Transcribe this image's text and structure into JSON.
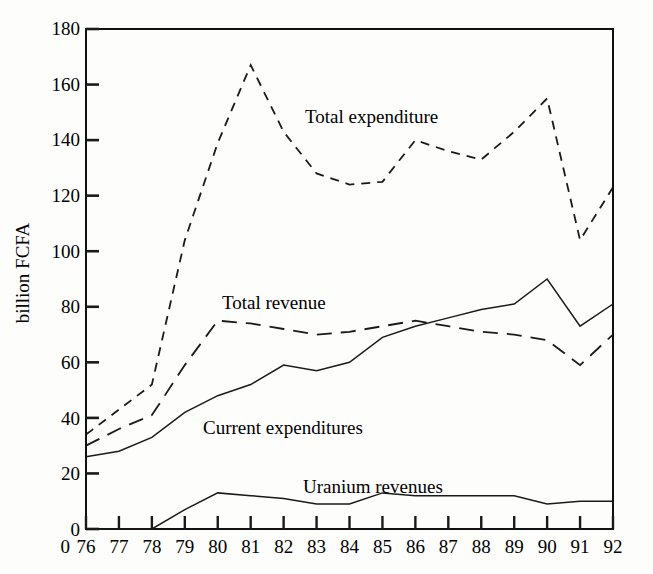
{
  "figure": {
    "background": "#fdfdfc",
    "ink": "#1a1a1a"
  },
  "axis": {
    "y_title": "billion FCFA",
    "y_ticks": [
      "180",
      "160",
      "140",
      "120",
      "100",
      "80",
      "60",
      "40",
      "20",
      "0"
    ],
    "x_zero_label": "0",
    "x_ticks": [
      "76",
      "77",
      "78",
      "79",
      "80",
      "81",
      "82",
      "83",
      "84",
      "85",
      "86",
      "87",
      "88",
      "89",
      "90",
      "91",
      "92"
    ]
  },
  "annotations": {
    "total_expenditure": "Total expenditure",
    "total_revenue": "Total revenue",
    "current_expenditures": "Current expenditures",
    "uranium_revenues": "Uranium revenues"
  },
  "chart_data": {
    "type": "line",
    "title": "",
    "xlabel": "",
    "ylabel": "billion FCFA",
    "xlim": [
      76,
      92
    ],
    "ylim": [
      0,
      180
    ],
    "ytick_step": 20,
    "grid": false,
    "legend": "inline-annotations",
    "x": [
      76,
      77,
      78,
      79,
      80,
      81,
      82,
      83,
      84,
      85,
      86,
      87,
      88,
      89,
      90,
      91,
      92
    ],
    "series": [
      {
        "name": "Total expenditure",
        "style": "dashed",
        "color": "#1a1a1a",
        "values": [
          34,
          43,
          52,
          104,
          139,
          167,
          143,
          128,
          124,
          125,
          140,
          136,
          133,
          143,
          155,
          104,
          123
        ]
      },
      {
        "name": "Total revenue",
        "style": "dashed-long",
        "color": "#1a1a1a",
        "values": [
          30,
          36,
          41,
          59,
          75,
          74,
          72,
          70,
          71,
          73,
          75,
          73,
          71,
          70,
          68,
          59,
          70
        ]
      },
      {
        "name": "Current expenditures",
        "style": "solid",
        "color": "#1a1a1a",
        "values": [
          26,
          28,
          33,
          42,
          48,
          52,
          59,
          57,
          60,
          69,
          73,
          76,
          79,
          81,
          90,
          73,
          81
        ]
      },
      {
        "name": "Uranium revenues",
        "style": "solid",
        "color": "#1a1a1a",
        "values": [
          0,
          0,
          0,
          7,
          13,
          12,
          11,
          9,
          9,
          13,
          12,
          12,
          12,
          12,
          9,
          10,
          10
        ]
      }
    ]
  }
}
